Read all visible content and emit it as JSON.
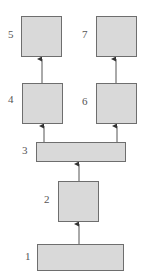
{
  "diagram": {
    "nodes": [
      {
        "id": "1",
        "label": "1"
      },
      {
        "id": "2",
        "label": "2"
      },
      {
        "id": "3",
        "label": "3"
      },
      {
        "id": "4",
        "label": "4"
      },
      {
        "id": "5",
        "label": "5"
      },
      {
        "id": "6",
        "label": "6"
      },
      {
        "id": "7",
        "label": "7"
      }
    ],
    "edges": [
      {
        "from": "1",
        "to": "2"
      },
      {
        "from": "2",
        "to": "3"
      },
      {
        "from": "3",
        "to": "4"
      },
      {
        "from": "3",
        "to": "6"
      },
      {
        "from": "4",
        "to": "5"
      },
      {
        "from": "6",
        "to": "7"
      }
    ],
    "colors": {
      "fill": "#d9d9d9",
      "stroke": "#6e6e6e",
      "text": "#555555"
    }
  }
}
